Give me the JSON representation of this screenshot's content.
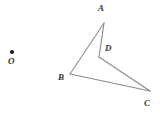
{
  "figure": {
    "background_color": "#ffffff",
    "stroke_color": "#8a8a8a",
    "label_color": "#333333",
    "dot_color": "#1a1a1a",
    "stroke_width": 1.1,
    "canvas": {
      "width": 160,
      "height": 115
    },
    "points": [
      {
        "id": "O",
        "label": "O",
        "x": 12,
        "y": 52,
        "is_dot": true,
        "label_x": 8,
        "label_y": 57
      },
      {
        "id": "A",
        "label": "A",
        "x": 104,
        "y": 23,
        "is_dot": false,
        "label_x": 98,
        "label_y": 4
      },
      {
        "id": "D",
        "label": "D",
        "x": 99,
        "y": 57,
        "is_dot": false,
        "label_x": 105,
        "label_y": 44
      },
      {
        "id": "B",
        "label": "B",
        "x": 70,
        "y": 74,
        "is_dot": false,
        "label_x": 58,
        "label_y": 73
      },
      {
        "id": "C",
        "label": "C",
        "x": 150,
        "y": 91,
        "is_dot": false,
        "label_x": 144,
        "label_y": 99
      }
    ],
    "segments": [
      {
        "id": "AB",
        "from": "A",
        "to": "B"
      },
      {
        "id": "AD",
        "from": "A",
        "to": "D"
      },
      {
        "id": "DC",
        "from": "D",
        "to": "C"
      },
      {
        "id": "BC",
        "from": "B",
        "to": "C"
      }
    ]
  }
}
